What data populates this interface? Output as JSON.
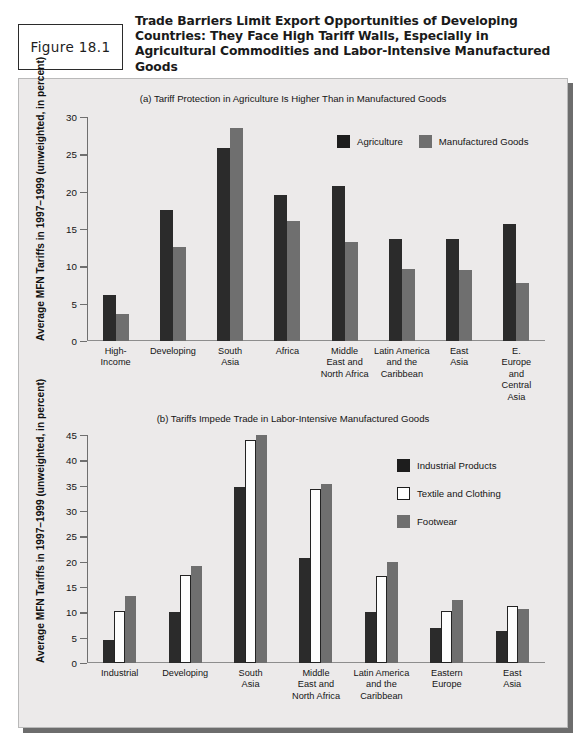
{
  "figure": {
    "number_label": "Figure 18.1",
    "title": "Trade Barriers Limit Export Opportunities of Developing Countries: They Face High Tariff Walls, Especially in Agricultural Commodities and Labor-Intensive Manufactured Goods"
  },
  "colors": {
    "dark": "#2b2b2b",
    "gray": "#6f6f6f",
    "white": "#ffffff",
    "panel_bg": "#eceaea",
    "shadow": "#6d6d6d"
  },
  "chart_data": [
    {
      "type": "bar",
      "panel": "a",
      "title": "(a) Tariff Protection in Agriculture Is Higher Than in Manufactured Goods",
      "ylabel": "Average MFN Tariffs in 1997–1999 (unweighted, in percent)",
      "xlabel": "",
      "ylim": [
        0,
        30
      ],
      "yticks": [
        0,
        5,
        10,
        15,
        20,
        25,
        30
      ],
      "grid": false,
      "legend_position": "top-right",
      "categories": [
        "High-\nIncome",
        "Developing",
        "South\nAsia",
        "Africa",
        "Middle\nEast and\nNorth Africa",
        "Latin America\nand the\nCaribbean",
        "East\nAsia",
        "E. Europe\nand\nCentral Asia"
      ],
      "series": [
        {
          "name": "Agriculture",
          "color": "#2b2b2b",
          "values": [
            6.2,
            17.5,
            25.9,
            19.5,
            20.8,
            13.7,
            13.6,
            15.7
          ]
        },
        {
          "name": "Manufactured Goods",
          "color": "#6f6f6f",
          "values": [
            3.6,
            12.6,
            28.5,
            16.1,
            13.2,
            9.6,
            9.5,
            7.8
          ]
        }
      ]
    },
    {
      "type": "bar",
      "panel": "b",
      "title": "(b) Tariffs Impede Trade in Labor-Intensive Manufactured Goods",
      "ylabel": "Average MFN Tariffs in 1997–1999 (unweighted, in percent)",
      "xlabel": "",
      "ylim": [
        0,
        45
      ],
      "yticks": [
        0,
        5,
        10,
        15,
        20,
        25,
        30,
        35,
        40,
        45
      ],
      "grid": false,
      "legend_position": "top-right",
      "categories": [
        "Industrial",
        "Developing",
        "South\nAsia",
        "Middle\nEast and\nNorth Africa",
        "Latin America\nand the\nCaribbean",
        "Eastern\nEurope",
        "East\nAsia"
      ],
      "series": [
        {
          "name": "Industrial Products",
          "color": "#2b2b2b",
          "values": [
            4.6,
            10.1,
            34.8,
            20.7,
            10.1,
            6.9,
            6.3
          ]
        },
        {
          "name": "Textile and Clothing",
          "color": "#ffffff",
          "values": [
            10.2,
            17.3,
            44.1,
            34.3,
            17.1,
            10.3,
            11.3
          ]
        },
        {
          "name": "Footwear",
          "color": "#6f6f6f",
          "values": [
            13.3,
            19.2,
            45.0,
            35.4,
            20.0,
            12.4,
            10.7
          ]
        }
      ]
    }
  ]
}
